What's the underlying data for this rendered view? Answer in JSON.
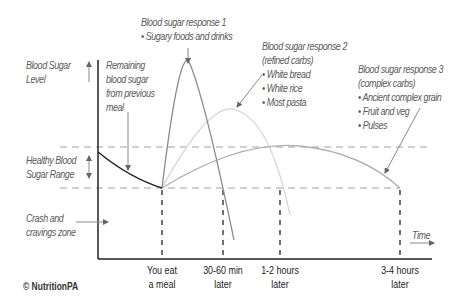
{
  "diagram": {
    "axes": {
      "y_label": "Blood Sugar Level",
      "x_label": "Time"
    },
    "zones": {
      "healthy_range": "Healthy Blood Sugar Range",
      "crash_zone": "Crash and cravings zone"
    },
    "annotations": {
      "remaining": "Remaining blood sugar from previous meal",
      "response1": {
        "title": "Blood sugar response 1",
        "items": [
          "Sugary foods and drinks"
        ]
      },
      "response2": {
        "title": "Blood sugar response 2",
        "subtitle": "(refined carbs)",
        "items": [
          "White bread",
          "White rice",
          "Most pasta"
        ]
      },
      "response3": {
        "title": "Blood sugar response 3",
        "subtitle": "(complex carbs)",
        "items": [
          "Ancient complex grain",
          "Fruit and veg",
          "Pulses"
        ]
      }
    },
    "time_ticks": [
      {
        "line1": "You eat",
        "line2": "a meal"
      },
      {
        "line1": "30-60 min",
        "line2": "later"
      },
      {
        "line1": "1-2 hours",
        "line2": "later"
      },
      {
        "line1": "3-4 hours",
        "line2": "later"
      }
    ],
    "copyright": "© NutritionPA",
    "colors": {
      "axis": "#222222",
      "remaining_curve": "#222222",
      "response1_curve": "#8c8c8c",
      "response2_curve": "#d4d4d4",
      "response3_curve": "#b0b0b0",
      "dashed_range": "#a0a0a0",
      "dashed_time": "#222222"
    }
  }
}
